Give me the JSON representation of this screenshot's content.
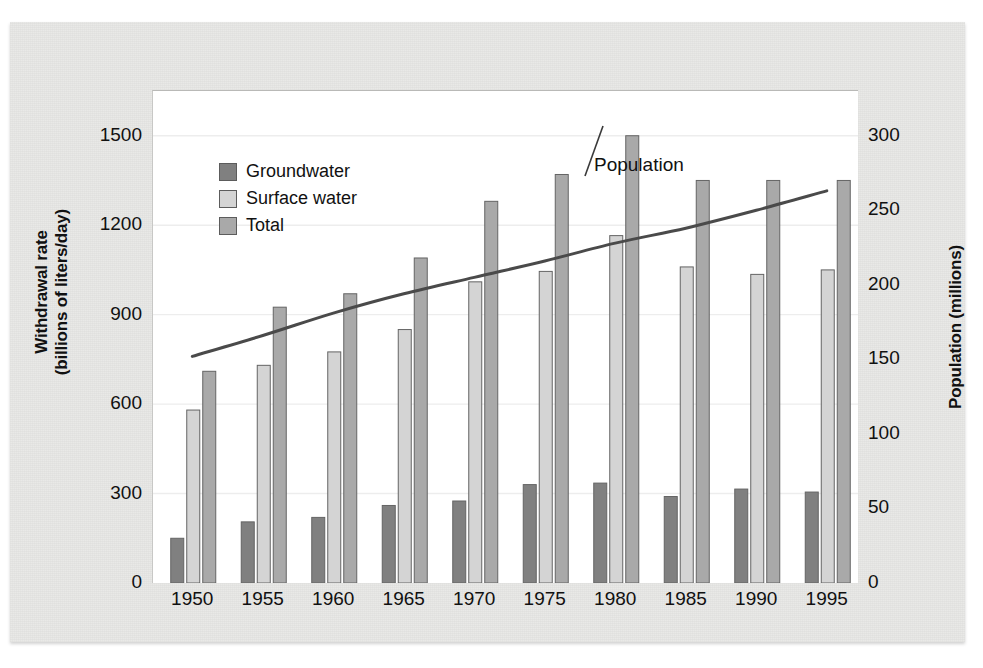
{
  "figure": {
    "background_color": "#e8e8e6",
    "panel_color": "#ffffff"
  },
  "legend": {
    "position": "top-left-inside",
    "items": [
      {
        "label": "Groundwater",
        "color": "#808080",
        "icon": "legend-swatch-icon"
      },
      {
        "label": "Surface water",
        "color": "#d4d4d4",
        "icon": "legend-swatch-icon"
      },
      {
        "label": "Total",
        "color": "#a9a9a9",
        "icon": "legend-swatch-icon"
      }
    ]
  },
  "annotations": {
    "population_label": "Population"
  },
  "axes": {
    "left": {
      "title_line1": "Withdrawal rate",
      "title_line2": "(billions of  liters/day)",
      "ticks": [
        "1500",
        "1200",
        "900",
        "600",
        "300",
        "0"
      ],
      "tick_values": [
        1500,
        1200,
        900,
        600,
        300,
        0
      ],
      "min": 0,
      "max": 1650
    },
    "right": {
      "title": "Population (millions)",
      "ticks": [
        "300",
        "250",
        "200",
        "150",
        "100",
        "50",
        "0"
      ],
      "tick_values": [
        300,
        250,
        200,
        150,
        100,
        50,
        0
      ],
      "min": 0,
      "max": 330
    },
    "bottom": {
      "ticks": [
        "1950",
        "1955",
        "1960",
        "1965",
        "1970",
        "1975",
        "1980",
        "1985",
        "1990",
        "1995"
      ]
    }
  },
  "chart_data": {
    "type": "bar",
    "title": "",
    "subtitle": "",
    "xlabel": "",
    "ylabel": "Withdrawal rate (billions of  liters/day)",
    "y2label": "Population (millions)",
    "categories": [
      "1950",
      "1955",
      "1960",
      "1965",
      "1970",
      "1975",
      "1980",
      "1985",
      "1990",
      "1995"
    ],
    "ylim": [
      0,
      1650
    ],
    "y2lim": [
      0,
      330
    ],
    "grid": "horizontal-light",
    "legend_position": "upper left",
    "series": [
      {
        "name": "Groundwater",
        "type": "bar",
        "axis": "left",
        "color": "#808080",
        "values": [
          150,
          205,
          220,
          260,
          275,
          330,
          335,
          290,
          315,
          305
        ]
      },
      {
        "name": "Surface water",
        "type": "bar",
        "axis": "left",
        "color": "#d4d4d4",
        "values": [
          580,
          730,
          775,
          850,
          1010,
          1045,
          1165,
          1060,
          1035,
          1050
        ]
      },
      {
        "name": "Total",
        "type": "bar",
        "axis": "left",
        "color": "#a9a9a9",
        "values": [
          710,
          925,
          970,
          1090,
          1280,
          1370,
          1500,
          1350,
          1350,
          1350
        ]
      },
      {
        "name": "Population",
        "type": "line",
        "axis": "right",
        "color": "#4a4a4a",
        "values": [
          152,
          166,
          181,
          194,
          205,
          216,
          228,
          238,
          250,
          263
        ]
      }
    ]
  }
}
